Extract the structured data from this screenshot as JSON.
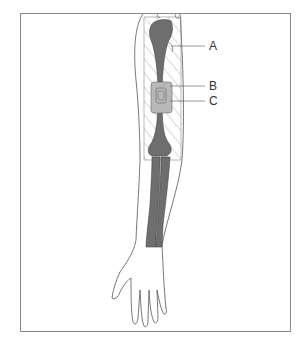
{
  "figure": {
    "labels": [
      {
        "id": "A",
        "text": "A",
        "target": "humerus head / hatched region edge"
      },
      {
        "id": "B",
        "text": "B",
        "target": "device outer housing"
      },
      {
        "id": "C",
        "text": "C",
        "target": "device inner component"
      }
    ],
    "colors": {
      "bone": "#6e6e6e",
      "device": "#b8b8b8",
      "outline": "#555555",
      "hatch": "#9a9a9a",
      "frame": "#8a8a8a"
    }
  }
}
